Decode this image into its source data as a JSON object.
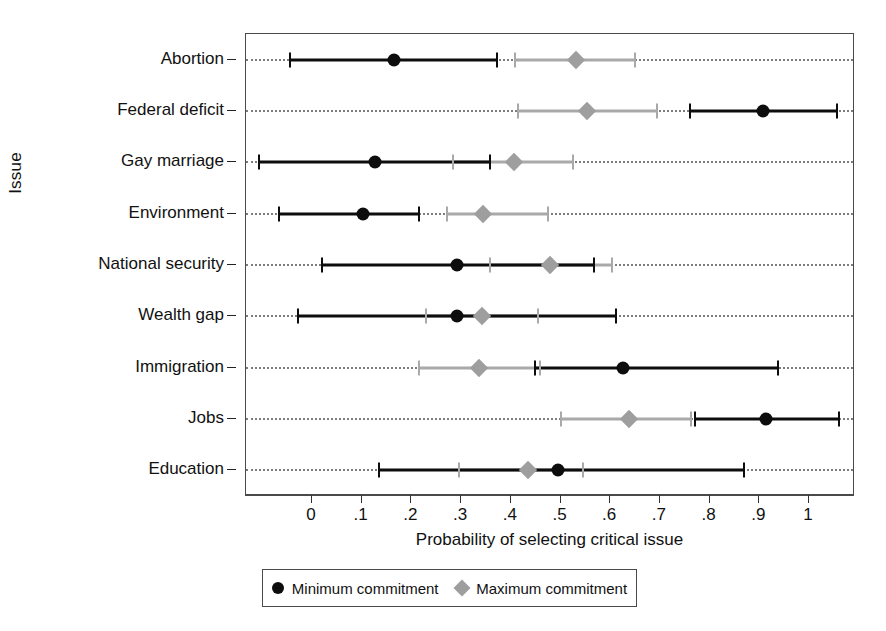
{
  "chart_data": {
    "type": "scatter",
    "title": "",
    "xlabel": "Probability of selecting critical issue",
    "ylabel": "Issue",
    "xlim": [
      -0.13,
      1.095
    ],
    "xticks": [
      0,
      0.1,
      0.2,
      0.3,
      0.4,
      0.5,
      0.6,
      0.7,
      0.8,
      0.9,
      1
    ],
    "xticklabels": [
      "0",
      ".1",
      ".2",
      ".3",
      ".4",
      ".5",
      ".6",
      ".7",
      ".8",
      ".9",
      "1"
    ],
    "grid": "horizontal-dotted",
    "legend_position": "below-axis",
    "categories": [
      "Abortion",
      "Federal deficit",
      "Gay marriage",
      "Environment",
      "National security",
      "Wealth gap",
      "Immigration",
      "Jobs",
      "Education"
    ],
    "series": [
      {
        "name": "Minimum commitment",
        "marker": "circle",
        "color": "#0d0d0d",
        "values": [
          0.165,
          0.907,
          0.127,
          0.103,
          0.292,
          0.292,
          0.625,
          0.913,
          0.495
        ],
        "ci_low": [
          -0.044,
          0.76,
          -0.107,
          -0.066,
          0.02,
          -0.029,
          0.448,
          0.77,
          0.135
        ],
        "ci_high": [
          0.372,
          1.056,
          0.358,
          0.215,
          0.567,
          0.612,
          0.938,
          1.06,
          0.87
        ]
      },
      {
        "name": "Maximum commitment",
        "marker": "diamond",
        "color": "#9e9e9e",
        "values": [
          0.531,
          0.553,
          0.406,
          0.344,
          0.479,
          0.342,
          0.337,
          0.638,
          0.435
        ],
        "ci_low": [
          0.409,
          0.415,
          0.284,
          0.272,
          0.358,
          0.229,
          0.215,
          0.5,
          0.295
        ],
        "ci_high": [
          0.65,
          0.694,
          0.525,
          0.475,
          0.604,
          0.455,
          0.458,
          0.762,
          0.545
        ]
      }
    ]
  },
  "legend": {
    "items": [
      {
        "label": "Minimum commitment",
        "marker": "circle-marker"
      },
      {
        "label": "Maximum commitment",
        "marker": "diamond-marker"
      }
    ]
  }
}
